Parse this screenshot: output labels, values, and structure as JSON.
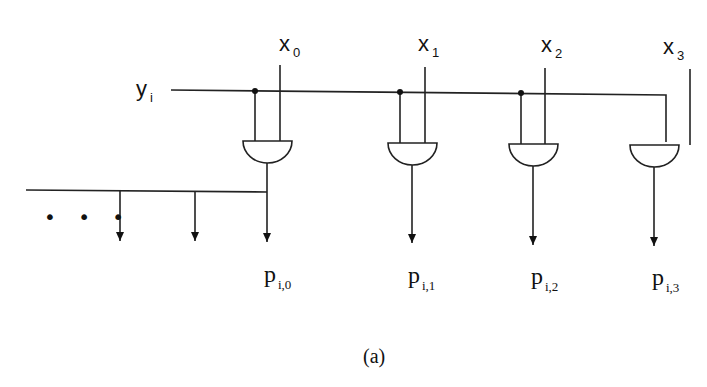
{
  "diagram": {
    "type": "array-multiplier-partial-product-row",
    "input_row": {
      "base": "y",
      "sub": "i"
    },
    "inputs": [
      {
        "base": "x",
        "sub": "0"
      },
      {
        "base": "x",
        "sub": "1"
      },
      {
        "base": "x",
        "sub": "2"
      },
      {
        "base": "x",
        "sub": "3"
      }
    ],
    "gates": [
      "AND",
      "AND",
      "AND",
      "AND"
    ],
    "outputs": [
      {
        "base": "p",
        "sub": "i,0"
      },
      {
        "base": "p",
        "sub": "i,1"
      },
      {
        "base": "p",
        "sub": "i,2"
      },
      {
        "base": "p",
        "sub": "i,3"
      }
    ],
    "ellipsis": "• • •",
    "caption": "(a)"
  }
}
